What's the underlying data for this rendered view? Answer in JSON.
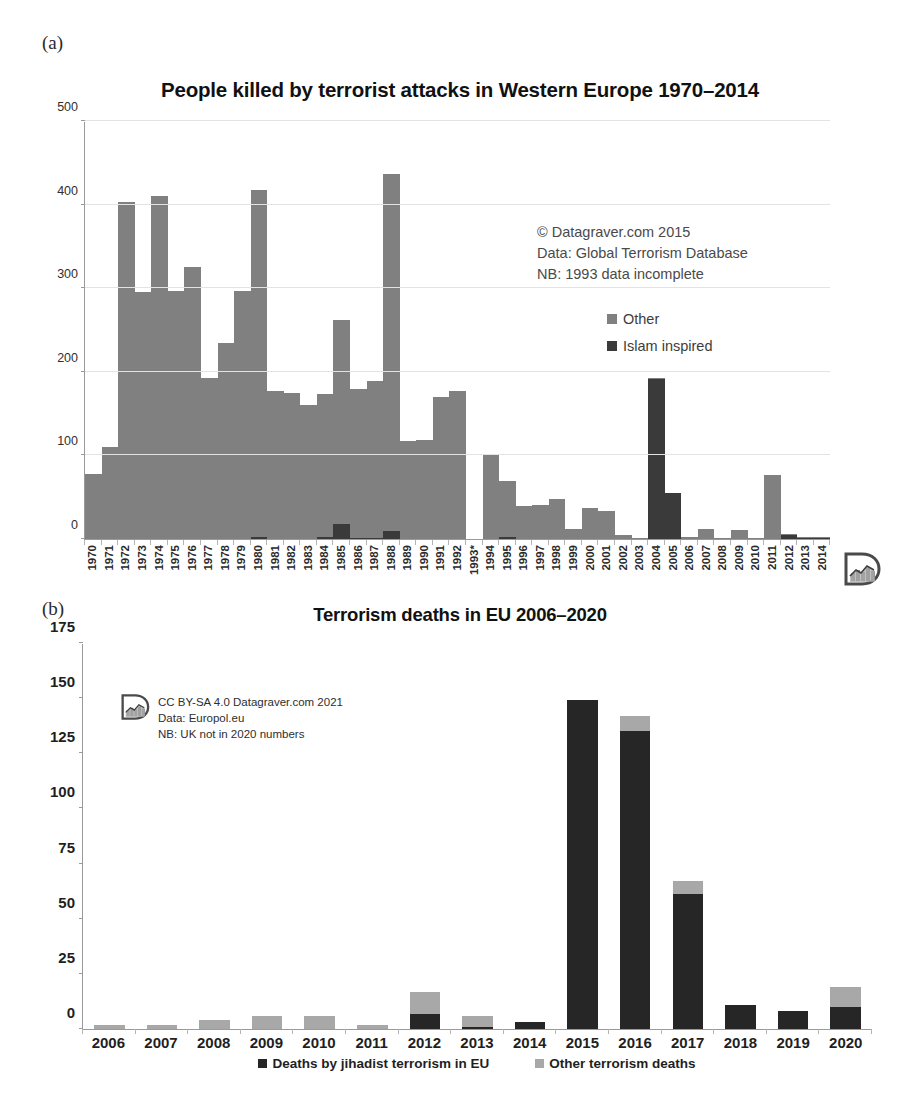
{
  "figure": {
    "panel_a_letter": "(a)",
    "panel_b_letter": "(b)"
  },
  "colors": {
    "other": "#808080",
    "jihadist": "#262626",
    "axis": "#9a9a9a",
    "grid": "#e3e3e3"
  },
  "panel_a": {
    "title": "People killed by terrorist attacks in Western Europe 1970–2014",
    "annotation": [
      "© Datagraver.com 2015",
      "Data: Global Terrorism Database",
      "NB: 1993 data incomplete"
    ],
    "legend": [
      {
        "label": "Other",
        "color": "#808080"
      },
      {
        "label": "Islam inspired",
        "color": "#3a3a3a"
      }
    ],
    "logo": "datagraver-logo"
  },
  "panel_b": {
    "title": "Terrorism deaths in EU  2006–2020",
    "annotation": [
      "CC BY-SA 4.0 Datagraver.com 2021",
      "Data: Europol.eu",
      "NB: UK not in 2020 numbers"
    ],
    "legend": [
      {
        "label": "Deaths by jihadist terrorism in EU",
        "color": "#262626"
      },
      {
        "label": "Other terrorism deaths",
        "color": "#a8a8a8"
      }
    ],
    "logo": "datagraver-logo"
  },
  "chart_data": [
    {
      "type": "bar",
      "stacked": true,
      "title": "People killed by terrorist attacks in Western Europe 1970–2014",
      "xlabel": "",
      "ylabel": "",
      "ylim": [
        0,
        500
      ],
      "yticks": [
        0,
        100,
        200,
        300,
        400,
        500
      ],
      "grid": true,
      "legend_position": "inside-right",
      "categories": [
        "1970",
        "1971",
        "1972",
        "1973",
        "1974",
        "1975",
        "1976",
        "1977",
        "1978",
        "1979",
        "1980",
        "1981",
        "1982",
        "1983",
        "1984",
        "1985",
        "1986",
        "1987",
        "1988",
        "1989",
        "1990",
        "1991",
        "1992",
        "1993*",
        "1994",
        "1995",
        "1996",
        "1997",
        "1998",
        "1999",
        "2000",
        "2001",
        "2002",
        "2003",
        "2004",
        "2005",
        "2006",
        "2007",
        "2008",
        "2009",
        "2010",
        "2011",
        "2012",
        "2013",
        "2014"
      ],
      "series": [
        {
          "name": "Islam inspired",
          "color": "#3a3a3a",
          "values": [
            0,
            0,
            0,
            0,
            0,
            0,
            0,
            0,
            0,
            0,
            2,
            0,
            0,
            0,
            2,
            18,
            1,
            1,
            10,
            0,
            0,
            0,
            0,
            0,
            0,
            3,
            0,
            0,
            0,
            0,
            0,
            0,
            0,
            0,
            191,
            55,
            0,
            0,
            0,
            0,
            0,
            0,
            5,
            1,
            1
          ]
        },
        {
          "name": "Other",
          "color": "#808080",
          "values": [
            78,
            110,
            403,
            295,
            410,
            297,
            325,
            193,
            235,
            297,
            415,
            177,
            175,
            160,
            172,
            244,
            179,
            188,
            427,
            117,
            118,
            170,
            177,
            0,
            100,
            67,
            40,
            41,
            48,
            12,
            37,
            33,
            5,
            1,
            2,
            0,
            2,
            12,
            1,
            11,
            1,
            76,
            1,
            2,
            1
          ]
        }
      ],
      "totals": [
        78,
        110,
        403,
        295,
        410,
        297,
        325,
        193,
        235,
        297,
        417,
        177,
        175,
        160,
        174,
        262,
        180,
        189,
        437,
        117,
        118,
        170,
        177,
        0,
        100,
        70,
        40,
        41,
        48,
        12,
        37,
        33,
        5,
        1,
        193,
        55,
        2,
        12,
        1,
        11,
        1,
        76,
        6,
        3,
        2
      ]
    },
    {
      "type": "bar",
      "stacked": true,
      "title": "Terrorism deaths in EU  2006–2020",
      "xlabel": "",
      "ylabel": "",
      "ylim": [
        0,
        175
      ],
      "yticks": [
        0,
        25,
        50,
        75,
        100,
        125,
        150,
        175
      ],
      "grid": false,
      "legend_position": "bottom",
      "categories": [
        "2006",
        "2007",
        "2008",
        "2009",
        "2010",
        "2011",
        "2012",
        "2013",
        "2014",
        "2015",
        "2016",
        "2017",
        "2018",
        "2019",
        "2020"
      ],
      "series": [
        {
          "name": "Deaths by jihadist terrorism in EU",
          "color": "#262626",
          "values": [
            0,
            0,
            0,
            0,
            0,
            0,
            7,
            1,
            3,
            149,
            135,
            61,
            11,
            8,
            10
          ]
        },
        {
          "name": "Other terrorism deaths",
          "color": "#a8a8a8",
          "values": [
            2,
            2,
            4,
            6,
            6,
            2,
            10,
            5,
            0,
            0,
            7,
            6,
            0,
            0,
            9
          ]
        }
      ],
      "totals": [
        2,
        2,
        4,
        6,
        6,
        2,
        17,
        6,
        3,
        149,
        142,
        67,
        11,
        8,
        19
      ]
    }
  ]
}
